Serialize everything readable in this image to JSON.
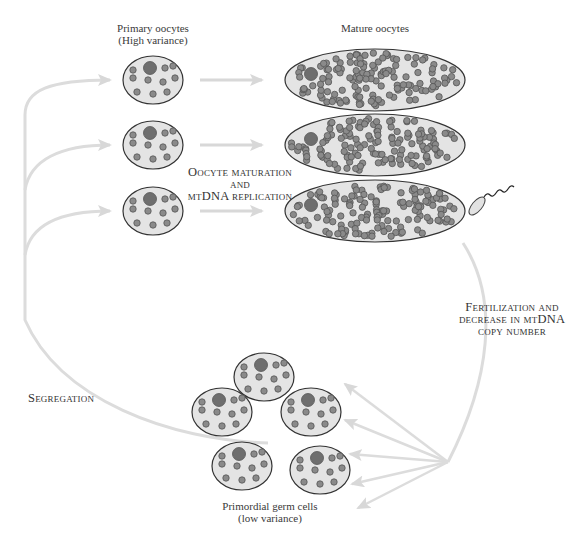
{
  "labels": {
    "primary_oocytes": [
      "Primary oocytes",
      "(High variance)"
    ],
    "mature_oocytes": "Mature oocytes",
    "maturation": [
      "Oocyte maturation",
      "and",
      "mtDNA replication"
    ],
    "fertilization": [
      "Fertilization and",
      "decrease in mtDNA",
      "copy number"
    ],
    "segregation": "Segregation",
    "pgc": [
      "Primordial germ cells",
      "(low variance)"
    ]
  },
  "colors": {
    "cell_fill": "#e4e4e4",
    "cell_stroke": "#333333",
    "mito_fill": "#8a8a8a",
    "mito_stroke": "#555555",
    "nucleus_fill": "#6e6e6e",
    "arrow": "#d8d8d8"
  },
  "primary_oocytes": [
    {
      "cx": 153,
      "cy": 80
    },
    {
      "cx": 153,
      "cy": 145
    },
    {
      "cx": 153,
      "cy": 211
    }
  ],
  "mature_oocytes": [
    {
      "cx": 375,
      "cy": 80
    },
    {
      "cx": 375,
      "cy": 145
    },
    {
      "cx": 375,
      "cy": 211
    }
  ],
  "pgc_cells": [
    {
      "cx": 264,
      "cy": 377
    },
    {
      "cx": 222,
      "cy": 412
    },
    {
      "cx": 311,
      "cy": 412
    },
    {
      "cx": 242,
      "cy": 466
    },
    {
      "cx": 320,
      "cy": 470
    }
  ]
}
